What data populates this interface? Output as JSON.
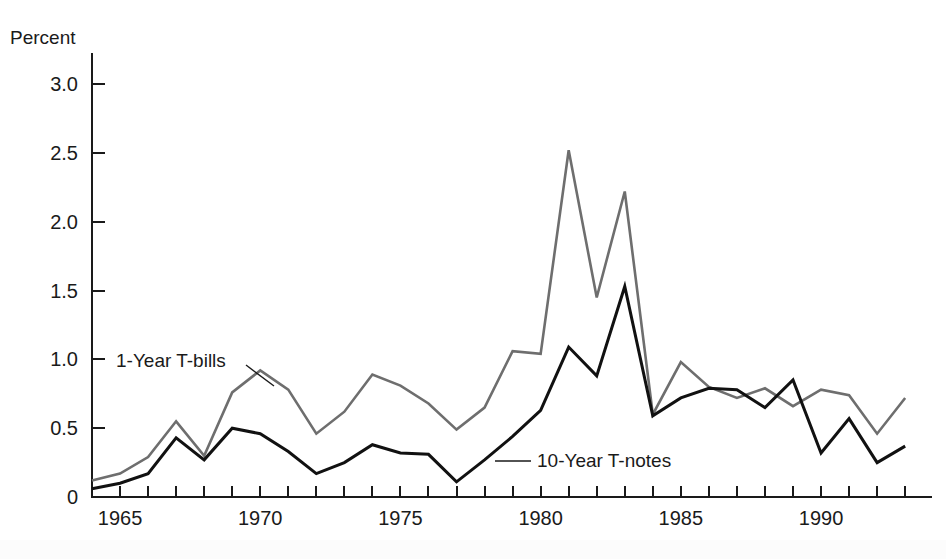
{
  "chart_data": {
    "type": "line",
    "title": "",
    "subtitle": "",
    "xlabel": "",
    "ylabel": "Percent",
    "ylabel_position": "top-left",
    "xlim": [
      1964,
      1993
    ],
    "ylim": [
      0,
      3.25
    ],
    "ytick_values": [
      0,
      0.5,
      1.0,
      1.5,
      2.0,
      2.5,
      3.0
    ],
    "ytick_labels": [
      "0",
      "0.5",
      "1.0",
      "1.5",
      "2.0",
      "2.5",
      "3.0"
    ],
    "xtick_values": [
      1964,
      1965,
      1966,
      1967,
      1968,
      1969,
      1970,
      1971,
      1972,
      1973,
      1974,
      1975,
      1976,
      1977,
      1978,
      1979,
      1980,
      1981,
      1982,
      1983,
      1984,
      1985,
      1986,
      1987,
      1988,
      1989,
      1990,
      1991,
      1992,
      1993
    ],
    "xtick_labels_shown": [
      "1965",
      "1970",
      "1975",
      "1980",
      "1985",
      "1990"
    ],
    "xtick_labeled_values": [
      1965,
      1970,
      1975,
      1980,
      1985,
      1990
    ],
    "grid": false,
    "legend_position": "inline-annotations",
    "x": [
      1964,
      1965,
      1966,
      1967,
      1968,
      1969,
      1970,
      1971,
      1972,
      1973,
      1974,
      1975,
      1976,
      1977,
      1978,
      1979,
      1980,
      1981,
      1982,
      1983,
      1984,
      1985,
      1986,
      1987,
      1988,
      1989,
      1990,
      1991,
      1992,
      1993
    ],
    "series": [
      {
        "name": "1-Year T-bills",
        "color": "#6e6e6e",
        "values": [
          0.12,
          0.17,
          0.29,
          0.55,
          0.3,
          0.76,
          0.92,
          0.78,
          0.46,
          0.62,
          0.89,
          0.81,
          0.68,
          0.49,
          0.65,
          1.06,
          1.04,
          2.52,
          1.45,
          2.22,
          0.6,
          0.98,
          0.8,
          0.72,
          0.79,
          0.66,
          0.78,
          0.74,
          0.46,
          0.72
        ]
      },
      {
        "name": "10-Year T-notes",
        "color": "#111111",
        "values": [
          0.06,
          0.1,
          0.17,
          0.43,
          0.27,
          0.5,
          0.46,
          0.33,
          0.17,
          0.25,
          0.38,
          0.32,
          0.31,
          0.11,
          0.27,
          0.44,
          0.63,
          1.09,
          0.88,
          1.53,
          0.59,
          0.72,
          0.79,
          0.78,
          0.65,
          0.85,
          0.32,
          0.57,
          0.25,
          0.37
        ]
      }
    ],
    "series_endpoints": {
      "1-Year T-bills": {
        "year": 1993,
        "value": 0.1
      },
      "10-Year T-notes": {
        "year": 1993,
        "value": 0.3
      }
    },
    "annotations": [
      {
        "name": "1-Year T-bills",
        "text": "1-Year T-bills",
        "text_x": 116,
        "text_y": 367,
        "leader_from_x": 246,
        "leader_from_y": 365,
        "leader_to_x": 274,
        "leader_to_y": 386
      },
      {
        "name": "10-Year T-notes",
        "text": "10-Year T-notes",
        "text_x": 537,
        "text_y": 467,
        "leader_from_x": 495,
        "leader_from_y": 461,
        "leader_to_x": 531,
        "leader_to_y": 461
      }
    ]
  },
  "axis": {
    "y_axis_title": "Percent",
    "y_axis_title_x": 10,
    "y_axis_title_y": 44,
    "plot_left_px": 92,
    "plot_right_px": 932,
    "plot_bottom_px": 497,
    "plot_top_px": 53,
    "px_per_year": 28.04,
    "px_per_unit": 137.6
  },
  "colors": {
    "background": "#ffffff",
    "axis": "#1a1a1a",
    "bills_line": "#6e6e6e",
    "notes_line": "#111111",
    "text": "#1a1a1a"
  }
}
